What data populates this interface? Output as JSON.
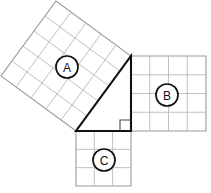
{
  "diagram": {
    "background_color": "#ffffff",
    "width": 211,
    "height": 193,
    "triangle": {
      "name": "right-triangle",
      "stroke_color": "#111111",
      "fill_color": "#ffffff",
      "vertices": [
        {
          "name": "left-vertex",
          "x": 76,
          "y": 131
        },
        {
          "name": "bottom-right-vertex",
          "x": 131,
          "y": 131
        },
        {
          "name": "top-vertex",
          "x": 131,
          "y": 56
        }
      ],
      "right_angle_at": "bottom-right-vertex",
      "right_angle_marker_size": 11,
      "leg_horizontal_length": 55,
      "leg_vertical_length": 75,
      "hypotenuse_length": 93
    },
    "squares": [
      {
        "id": "A",
        "label": "A",
        "name": "square-a",
        "attached_side": "hypotenuse",
        "grid_rows": 5,
        "grid_cols": 5,
        "side_length": 93,
        "rotated": true,
        "rotation_deg": -53.7,
        "origin_x": 76,
        "origin_y": 131,
        "grid_color": "#b9b9b9",
        "outline_color": "#9a9a9a",
        "label_center_x": 67,
        "label_center_y": 67,
        "label_radius": 11
      },
      {
        "id": "B",
        "label": "B",
        "name": "square-b",
        "attached_side": "vertical-leg",
        "grid_rows": 4,
        "grid_cols": 4,
        "side_length": 75,
        "rotated": false,
        "rotation_deg": 0,
        "origin_x": 131,
        "origin_y": 56,
        "grid_color": "#b9b9b9",
        "outline_color": "#9a9a9a",
        "label_center_x": 167,
        "label_center_y": 95,
        "label_radius": 11
      },
      {
        "id": "C",
        "label": "C",
        "name": "square-c",
        "attached_side": "horizontal-leg",
        "grid_rows": 3,
        "grid_cols": 3,
        "side_length": 55,
        "rotated": false,
        "rotation_deg": 0,
        "origin_x": 76,
        "origin_y": 131,
        "grid_color": "#b9b9b9",
        "outline_color": "#9a9a9a",
        "label_center_x": 104,
        "label_center_y": 160,
        "label_radius": 11
      }
    ]
  }
}
